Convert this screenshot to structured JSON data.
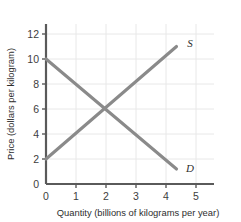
{
  "chart_data": {
    "type": "line",
    "title": "",
    "xlabel": "Quantity (billions of kilograms per year)",
    "ylabel": "Price (dollars per kilogram)",
    "xlim": [
      0,
      5.6
    ],
    "ylim": [
      0,
      12.8
    ],
    "xticks": [
      "0",
      "1",
      "2",
      "3",
      "4",
      "5"
    ],
    "xtick_values": [
      0,
      1,
      2,
      3,
      4,
      5
    ],
    "yticks": [
      "0",
      "2",
      "4",
      "6",
      "8",
      "10",
      "12"
    ],
    "ytick_values": [
      0,
      2,
      4,
      6,
      8,
      10,
      12
    ],
    "grid": true,
    "legend_position": "inline-curve-labels",
    "line_color": "#8a8a8a",
    "axis_color": "#5a5a5a",
    "grid_color": "#e8e8e8",
    "background_color": "#ffffff",
    "series": [
      {
        "name": "S",
        "label": "S",
        "description": "supply curve, upward sloping",
        "x": [
          0.0,
          4.35
        ],
        "y": [
          2.0,
          11.0
        ],
        "label_x": 4.8,
        "label_y": 11.3
      },
      {
        "name": "D",
        "label": "D",
        "description": "demand curve, downward sloping",
        "x": [
          0.0,
          4.35
        ],
        "y": [
          10.0,
          1.2
        ],
        "label_x": 4.8,
        "label_y": 1.25
      }
    ],
    "equilibrium": {
      "x": 2,
      "y": 6
    }
  }
}
